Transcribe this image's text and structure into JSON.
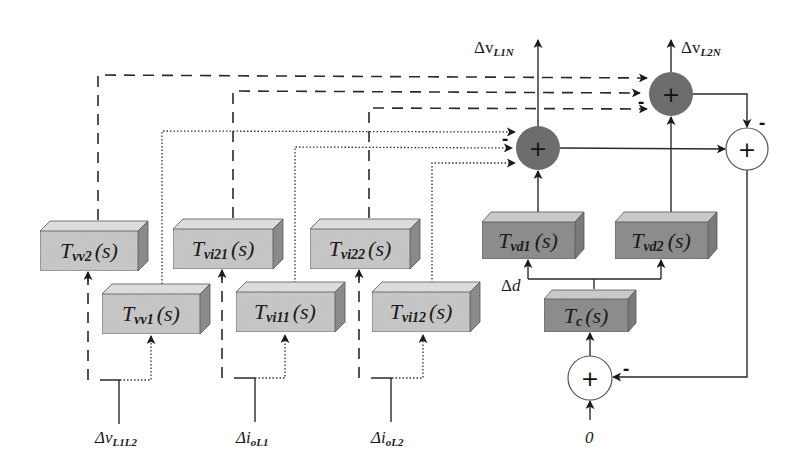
{
  "diagram": {
    "type": "block-diagram",
    "colors": {
      "light_block": "#c8c8c8",
      "dark_block": "#8e8e8e",
      "dark_summer": "#6e6e6e",
      "white_summer": "#ffffff",
      "line": "#2a2a2a"
    },
    "outputs": {
      "v_l1n": {
        "base": "Δv",
        "sub": "L1N"
      },
      "v_l2n": {
        "base": "Δv",
        "sub": "L2N"
      }
    },
    "inputs": {
      "v_l1l2": {
        "base": "Δv",
        "sub": "L1L2"
      },
      "i_ol1": {
        "base": "Δi",
        "sub": "oL1"
      },
      "i_ol2": {
        "base": "Δi",
        "sub": "oL2"
      },
      "zero": "0",
      "duty": {
        "base": "Δ",
        "var": "d"
      }
    },
    "blocks": {
      "tvv2": {
        "T": "T",
        "sub": "vv2",
        "s": "(s)"
      },
      "tvi21": {
        "T": "T",
        "sub": "vi21",
        "s": "(s)"
      },
      "tvi22": {
        "T": "T",
        "sub": "vi22",
        "s": "(s)"
      },
      "tvv1": {
        "T": "T",
        "sub": "vv1",
        "s": "(s)"
      },
      "tvi11": {
        "T": "T",
        "sub": "vi11",
        "s": "(s)"
      },
      "tvi12": {
        "T": "T",
        "sub": "vi12",
        "s": "(s)"
      },
      "tvd1": {
        "T": "T",
        "sub": "vd1",
        "s": "(s)"
      },
      "tvd2": {
        "T": "T",
        "sub": "vd2",
        "s": "(s)"
      },
      "tc": {
        "T": "T",
        "sub": "c",
        "s": "(s)"
      }
    },
    "summers": {
      "sum1": {
        "symbol": "+",
        "minus": "-"
      },
      "sum2": {
        "symbol": "+",
        "minus": "-"
      },
      "sum3": {
        "symbol": "+",
        "minus": "-"
      },
      "sum4": {
        "symbol": "+",
        "minus": "-"
      }
    }
  }
}
